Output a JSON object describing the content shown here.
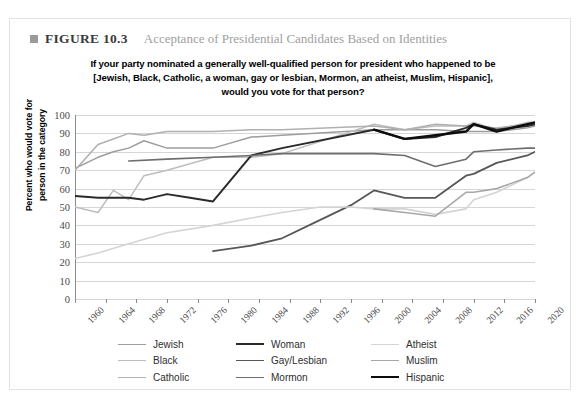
{
  "figure": {
    "marker_icon": "square-bullet-icon",
    "label": "FIGURE 10.3",
    "caption": "Acceptance of Presidential Candidates Based on Identities"
  },
  "chart_data": {
    "type": "line",
    "title_lines": [
      "If your party nominated a generally well-qualified person for president who happened to be",
      "[Jewish, Black, Catholic, a woman, gay or lesbian, Mormon, an atheist, Muslim, Hispanic],",
      "would you vote for that person?"
    ],
    "xlabel": "",
    "ylabel": "Percent who would vote for person in the category",
    "ylabel_lines": [
      "Percent who would vote for",
      "person in the category"
    ],
    "xlim": [
      1960,
      2020
    ],
    "ylim": [
      0,
      100
    ],
    "yticks": [
      0,
      10,
      20,
      30,
      40,
      50,
      60,
      70,
      80,
      90,
      100
    ],
    "xticks": [
      1960,
      1964,
      1968,
      1972,
      1976,
      1980,
      1984,
      1988,
      1992,
      1996,
      2000,
      2004,
      2008,
      2012,
      2016,
      2020
    ],
    "grid": true,
    "legend_position": "bottom",
    "legend_columns": 3,
    "series": [
      {
        "name": "Jewish",
        "color": "#9d9d9d",
        "width": 1.5,
        "points": [
          [
            1960,
            71
          ],
          [
            1963,
            77
          ],
          [
            1965,
            80
          ],
          [
            1967,
            82
          ],
          [
            1969,
            86
          ],
          [
            1972,
            82
          ],
          [
            1978,
            82
          ],
          [
            1983,
            88
          ],
          [
            1987,
            89
          ],
          [
            1999,
            92
          ],
          [
            2003,
            92
          ],
          [
            2007,
            92
          ],
          [
            2011,
            91
          ],
          [
            2012,
            91
          ],
          [
            2015,
            91
          ],
          [
            2019,
            93
          ],
          [
            2020,
            94
          ]
        ]
      },
      {
        "name": "Black",
        "color": "#bdbdbd",
        "width": 1.5,
        "points": [
          [
            1960,
            50
          ],
          [
            1963,
            47
          ],
          [
            1965,
            59
          ],
          [
            1967,
            54
          ],
          [
            1969,
            67
          ],
          [
            1972,
            70
          ],
          [
            1978,
            77
          ],
          [
            1983,
            77
          ],
          [
            1987,
            79
          ],
          [
            1999,
            95
          ],
          [
            2003,
            92
          ],
          [
            2007,
            94
          ],
          [
            2011,
            94
          ],
          [
            2012,
            96
          ],
          [
            2015,
            92
          ],
          [
            2019,
            96
          ],
          [
            2020,
            96
          ]
        ]
      },
      {
        "name": "Catholic",
        "color": "#b0b0b0",
        "width": 1.5,
        "points": [
          [
            1960,
            70
          ],
          [
            1963,
            84
          ],
          [
            1965,
            87
          ],
          [
            1967,
            90
          ],
          [
            1969,
            89
          ],
          [
            1972,
            91
          ],
          [
            1978,
            91
          ],
          [
            1983,
            92
          ],
          [
            1987,
            92
          ],
          [
            1999,
            94
          ],
          [
            2003,
            92
          ],
          [
            2007,
            95
          ],
          [
            2011,
            94
          ],
          [
            2012,
            94
          ],
          [
            2015,
            93
          ],
          [
            2019,
            95
          ],
          [
            2020,
            95
          ]
        ]
      },
      {
        "name": "Woman",
        "color": "#2b2b2b",
        "width": 2,
        "points": [
          [
            1960,
            56
          ],
          [
            1963,
            55
          ],
          [
            1965,
            55
          ],
          [
            1967,
            55
          ],
          [
            1969,
            54
          ],
          [
            1972,
            57
          ],
          [
            1975,
            55
          ],
          [
            1978,
            53
          ],
          [
            1983,
            78
          ],
          [
            1987,
            82
          ],
          [
            1999,
            92
          ],
          [
            2003,
            87
          ],
          [
            2007,
            88
          ],
          [
            2011,
            93
          ],
          [
            2012,
            95
          ],
          [
            2015,
            92
          ],
          [
            2019,
            94
          ],
          [
            2020,
            95
          ]
        ]
      },
      {
        "name": "Gay/Lesbian",
        "color": "#575757",
        "width": 1.8,
        "points": [
          [
            1978,
            26
          ],
          [
            1983,
            29
          ],
          [
            1987,
            33
          ],
          [
            1992,
            43
          ],
          [
            1996,
            51
          ],
          [
            1999,
            59
          ],
          [
            2003,
            55
          ],
          [
            2007,
            55
          ],
          [
            2011,
            67
          ],
          [
            2012,
            68
          ],
          [
            2015,
            74
          ],
          [
            2019,
            78
          ],
          [
            2020,
            80
          ]
        ]
      },
      {
        "name": "Mormon",
        "color": "#6e6e6e",
        "width": 1.6,
        "points": [
          [
            1967,
            75
          ],
          [
            1972,
            76
          ],
          [
            1978,
            77
          ],
          [
            1983,
            78
          ],
          [
            1987,
            79
          ],
          [
            1999,
            79
          ],
          [
            2003,
            78
          ],
          [
            2007,
            72
          ],
          [
            2011,
            76
          ],
          [
            2012,
            80
          ],
          [
            2015,
            81
          ],
          [
            2019,
            82
          ],
          [
            2020,
            82
          ]
        ]
      },
      {
        "name": "Atheist",
        "color": "#d4d4d4",
        "width": 1.6,
        "points": [
          [
            1960,
            22
          ],
          [
            1963,
            25
          ],
          [
            1967,
            30
          ],
          [
            1972,
            36
          ],
          [
            1978,
            40
          ],
          [
            1983,
            44
          ],
          [
            1987,
            47
          ],
          [
            1992,
            50
          ],
          [
            1996,
            50
          ],
          [
            1999,
            49
          ],
          [
            2003,
            49
          ],
          [
            2007,
            46
          ],
          [
            2011,
            49
          ],
          [
            2012,
            54
          ],
          [
            2015,
            58
          ],
          [
            2019,
            66
          ],
          [
            2020,
            69
          ]
        ]
      },
      {
        "name": "Muslim",
        "color": "#a8a8a8",
        "width": 1.6,
        "points": [
          [
            1999,
            49
          ],
          [
            2003,
            47
          ],
          [
            2007,
            45
          ],
          [
            2011,
            58
          ],
          [
            2012,
            58
          ],
          [
            2015,
            60
          ],
          [
            2019,
            66
          ],
          [
            2020,
            69
          ]
        ]
      },
      {
        "name": "Hispanic",
        "color": "#0d0d0d",
        "width": 2.4,
        "points": [
          [
            1999,
            92
          ],
          [
            2003,
            87
          ],
          [
            2007,
            89
          ],
          [
            2011,
            91
          ],
          [
            2012,
            95
          ],
          [
            2015,
            91
          ],
          [
            2019,
            95
          ],
          [
            2020,
            96
          ]
        ]
      }
    ]
  }
}
